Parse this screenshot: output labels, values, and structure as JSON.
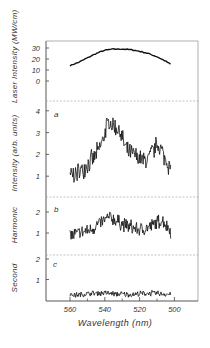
{
  "figure": {
    "xlabel": "Wavelength (nm)",
    "panel_ylabels": {
      "laser": "Laser Intensity (MW/cm)",
      "a": "Intensity (arb. units)",
      "b": "Harmonic",
      "c": "Second"
    },
    "panel_letters": {
      "a": "a",
      "b": "b",
      "c": "c"
    }
  },
  "chart_data": [
    {
      "type": "line",
      "panel": "laser",
      "title": "",
      "xlabel": "Wavelength (nm)",
      "ylabel": "Laser Intensity (MW/cm)",
      "xlim": [
        574,
        488
      ],
      "ylim": [
        0,
        35
      ],
      "yticks": [
        0,
        10,
        20,
        30
      ],
      "x": [
        560,
        555,
        550,
        545,
        540,
        535,
        530,
        525,
        520,
        515,
        510,
        505,
        502
      ],
      "y": [
        14,
        17,
        21,
        25,
        28,
        29,
        29,
        28.5,
        27,
        25,
        22,
        18,
        15
      ],
      "noise": 0.4,
      "grid": false
    },
    {
      "type": "line",
      "panel": "a",
      "label": "a",
      "ylabel": "Intensity (arb. units)",
      "xlim": [
        574,
        488
      ],
      "ylim": [
        0,
        4.3
      ],
      "yticks": [
        1,
        2,
        3,
        4
      ],
      "x": [
        560,
        557,
        553,
        550,
        546,
        543,
        541,
        539,
        537,
        535,
        533,
        531,
        529,
        527,
        524,
        521,
        518,
        515,
        512,
        510,
        508,
        506,
        503,
        502
      ],
      "y": [
        1.05,
        1.1,
        1.3,
        1.55,
        1.85,
        2.25,
        2.7,
        3.3,
        3.45,
        3.3,
        3.2,
        3.0,
        2.5,
        2.1,
        2.0,
        1.85,
        1.7,
        1.8,
        2.2,
        2.45,
        2.3,
        1.9,
        1.5,
        1.35
      ],
      "noise": 0.38,
      "grid": false
    },
    {
      "type": "line",
      "panel": "b",
      "label": "b",
      "ylabel": "Harmonic",
      "xlim": [
        574,
        488
      ],
      "ylim": [
        0.3,
        2.3
      ],
      "yticks": [
        1,
        2
      ],
      "x": [
        560,
        556,
        552,
        548,
        544,
        540,
        537,
        534,
        530,
        526,
        522,
        518,
        514,
        510,
        507,
        505,
        502
      ],
      "y": [
        0.9,
        0.95,
        1.05,
        1.15,
        1.4,
        1.6,
        1.75,
        1.6,
        1.45,
        1.3,
        1.2,
        1.15,
        1.3,
        1.5,
        1.6,
        1.4,
        1.1
      ],
      "noise": 0.3,
      "grid": false
    },
    {
      "type": "line",
      "panel": "c",
      "label": "c",
      "ylabel": "Second",
      "xlim": [
        574,
        488
      ],
      "ylim": [
        0,
        2.1
      ],
      "yticks": [
        1,
        2
      ],
      "x": [
        560,
        555,
        550,
        545,
        540,
        535,
        530,
        525,
        520,
        515,
        510,
        505,
        502
      ],
      "y": [
        0.25,
        0.25,
        0.3,
        0.33,
        0.35,
        0.3,
        0.28,
        0.27,
        0.3,
        0.33,
        0.32,
        0.3,
        0.27
      ],
      "noise": 0.12,
      "grid": false
    }
  ],
  "xaxis": {
    "ticks": [
      560,
      540,
      520,
      500
    ],
    "tick_labels": [
      "560",
      "540",
      "520",
      "500"
    ],
    "minor_ticks": [
      550,
      530,
      510
    ]
  }
}
